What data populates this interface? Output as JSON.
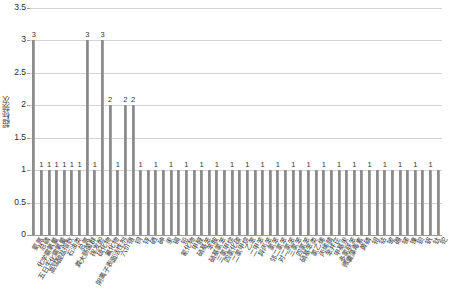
{
  "chart_data": {
    "type": "bar",
    "title": "",
    "xlabel": "",
    "ylabel": "超标频次",
    "ylim": [
      0,
      3.5
    ],
    "yticks": [
      "0",
      "0.5",
      "1",
      "1.5",
      "2",
      "2.5",
      "3",
      "3.5"
    ],
    "ytick_values": [
      0,
      0.5,
      1,
      1.5,
      2,
      2.5,
      3,
      3.5
    ],
    "grid": true,
    "legend": "none",
    "categories": [
      "氨氮",
      "总磷",
      "化学需氧量",
      "五日生化需氧量",
      "高锰酸盐指数",
      "石油类",
      "总氮",
      "粪大肠菌群",
      "挥发酚",
      "硫化物",
      "氟化物",
      "阴离子表面活性剂",
      "六价铬",
      "铜",
      "锌",
      "硒",
      "砷",
      "汞",
      "镉",
      "铅",
      "氰化物",
      "甲醛",
      "硝基苯",
      "苯胺",
      "硝基氯苯",
      "三氯甲烷",
      "四氯化碳",
      "二氯甲烷",
      "乙苯",
      "二甲苯",
      "异丙苯",
      "氯苯",
      "邻二氯苯",
      "对二氯苯",
      "三氯苯",
      "四氯苯",
      "硝基苯类",
      "氯乙烯",
      "丙烯腈",
      "苯并芘",
      "甲基汞",
      "多氯联苯",
      "微囊藻毒素",
      "黄磷",
      "钼",
      "钴",
      "铍",
      "硼",
      "锑",
      "镍",
      "钡",
      "钒",
      "钛",
      "铊"
    ],
    "values": [
      3,
      1,
      1,
      1,
      1,
      1,
      1,
      3,
      1,
      3,
      2,
      1,
      2,
      2,
      1,
      1,
      1,
      1,
      1,
      1,
      1,
      1,
      1,
      1,
      1,
      1,
      1,
      1,
      1,
      1,
      1,
      1,
      1,
      1,
      1,
      1,
      1,
      1,
      1,
      1,
      1,
      1,
      1,
      1,
      1,
      1,
      1,
      1,
      1,
      1,
      1,
      1,
      1,
      1
    ],
    "bar_value_labels": [
      "3",
      "1",
      "1",
      "1",
      "1",
      "1",
      "1",
      "3",
      "1",
      "3",
      "2",
      "1",
      "2",
      "2",
      "1",
      "",
      "1",
      "",
      "1",
      "",
      "1",
      "",
      "1",
      "",
      "1",
      "",
      "1",
      "",
      "1",
      "",
      "1",
      "",
      "1",
      "",
      "1",
      "",
      "1",
      "",
      "1",
      "",
      "1",
      "",
      "1",
      "",
      "1",
      "",
      "1",
      "",
      "1",
      "",
      "1",
      "",
      "1",
      ""
    ],
    "colors": {
      "bar": "#8e8e8e",
      "grid": "#d4d4d4",
      "axis": "#9a9a9a",
      "text": "#2b2b2b"
    }
  },
  "caption": ""
}
